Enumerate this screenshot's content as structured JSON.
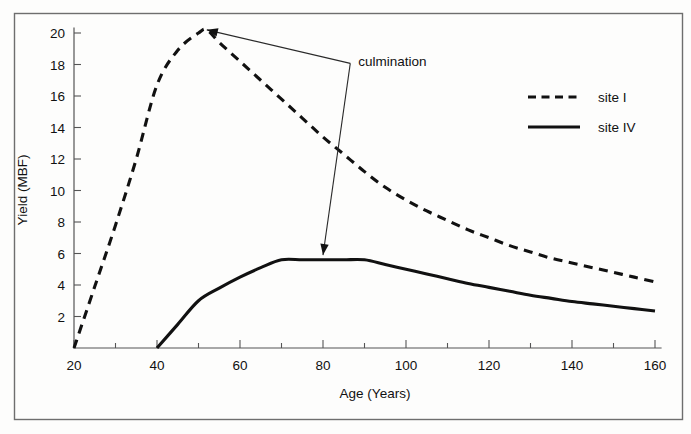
{
  "chart_data": {
    "type": "line",
    "title": "",
    "xlabel": "Age (Years)",
    "ylabel": "Yield (MBF)",
    "xlim": [
      20,
      160
    ],
    "ylim": [
      0,
      20.8
    ],
    "grid": false,
    "legend_position": "top-right",
    "x_ticks_major": [
      20,
      40,
      60,
      80,
      100,
      120,
      140,
      160
    ],
    "x_ticks_minor": [
      30,
      50,
      70,
      90,
      110,
      130,
      150
    ],
    "y_ticks_major": [
      2,
      4,
      6,
      8,
      10,
      12,
      14,
      16,
      18,
      20
    ],
    "series": [
      {
        "name": "site I",
        "style": "dashed",
        "color": "#111111",
        "x": [
          20,
          25,
          30,
          35,
          40,
          45,
          50,
          52,
          55,
          60,
          65,
          70,
          75,
          80,
          85,
          90,
          95,
          100,
          105,
          110,
          115,
          120,
          125,
          130,
          135,
          140,
          145,
          150,
          155,
          160
        ],
        "y": [
          0.0,
          3.9,
          7.8,
          12.0,
          16.7,
          18.9,
          20.0,
          20.2,
          19.4,
          18.2,
          17.0,
          15.8,
          14.6,
          13.4,
          12.3,
          11.2,
          10.2,
          9.4,
          8.7,
          8.1,
          7.5,
          7.0,
          6.5,
          6.1,
          5.7,
          5.4,
          5.1,
          4.8,
          4.5,
          4.2
        ]
      },
      {
        "name": "site IV",
        "style": "solid",
        "color": "#111111",
        "x": [
          40,
          45,
          50,
          55,
          60,
          65,
          70,
          75,
          80,
          85,
          90,
          95,
          100,
          105,
          110,
          115,
          120,
          125,
          130,
          135,
          140,
          145,
          150,
          155,
          160
        ],
        "y": [
          0.0,
          1.5,
          3.0,
          3.8,
          4.5,
          5.1,
          5.6,
          5.6,
          5.6,
          5.6,
          5.6,
          5.3,
          5.0,
          4.7,
          4.4,
          4.1,
          3.85,
          3.6,
          3.35,
          3.15,
          2.95,
          2.8,
          2.65,
          2.5,
          2.35
        ]
      }
    ],
    "annotations": [
      {
        "text": "culmination",
        "text_x": 88.5,
        "text_y": 18.2,
        "targets": [
          {
            "x": 52.0,
            "y": 20.2
          },
          {
            "x": 80.0,
            "y": 5.9
          }
        ]
      }
    ],
    "legend": [
      {
        "label": "site I",
        "style": "dashed"
      },
      {
        "label": "site IV",
        "style": "solid"
      }
    ]
  },
  "figure": {
    "border_color": "#6e6e6e",
    "background": "#fdfdfc",
    "axis_color": "#555555",
    "ink_color": "#111111"
  }
}
